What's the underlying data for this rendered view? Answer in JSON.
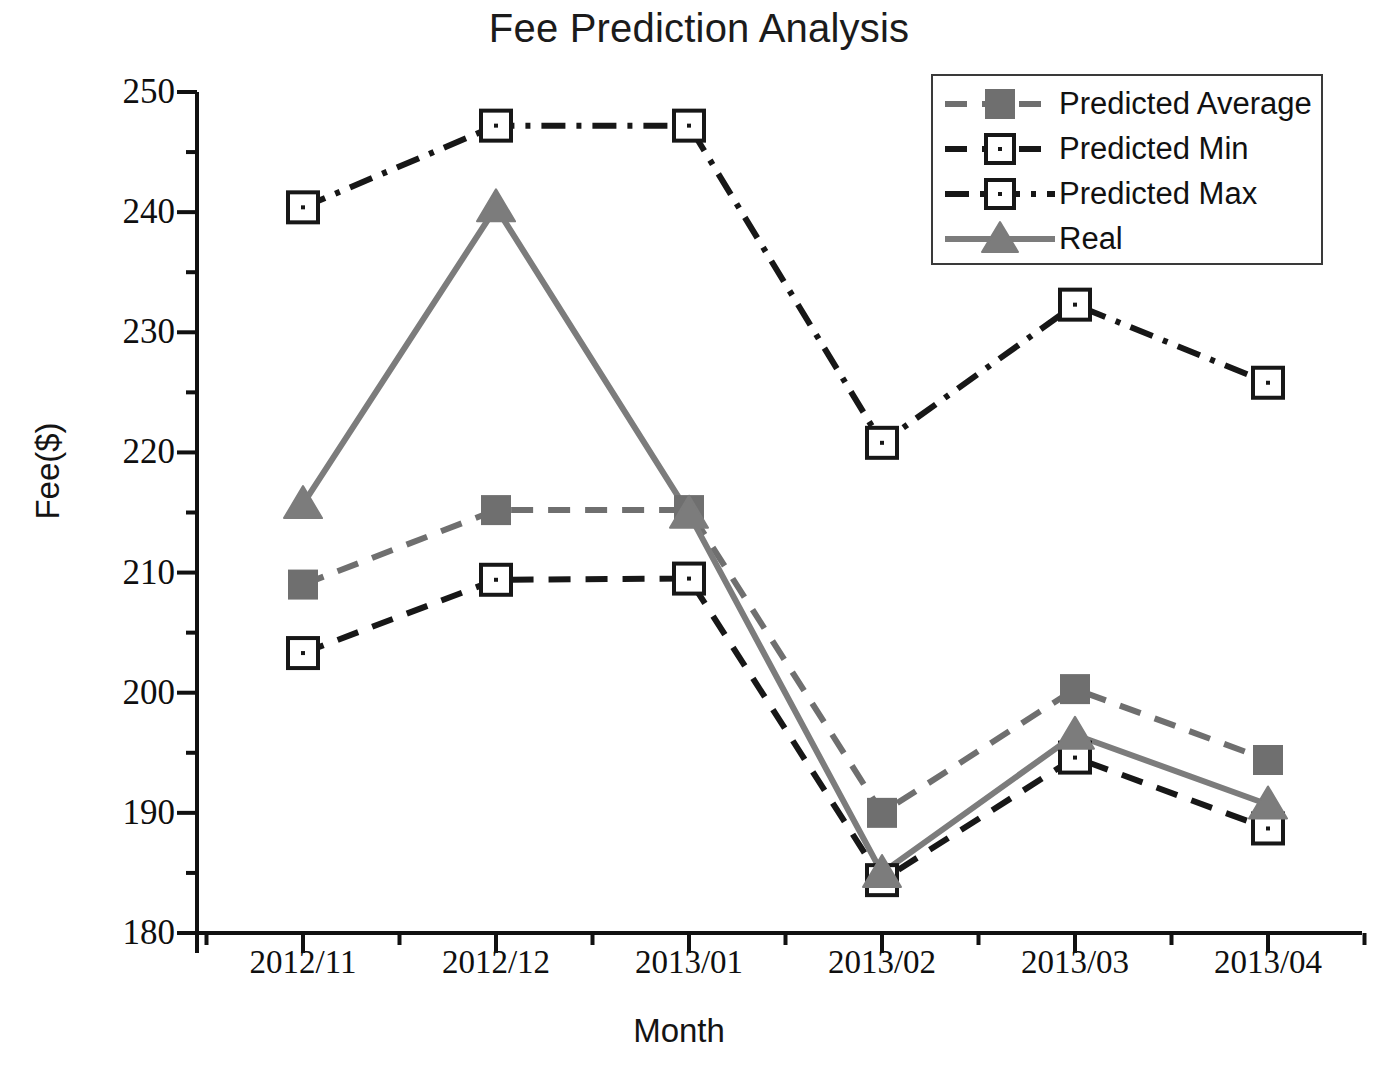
{
  "chart_data": {
    "type": "line",
    "title": "Fee Prediction Analysis",
    "xlabel": "Month",
    "ylabel": "Fee($)",
    "categories": [
      "2012/11",
      "2012/12",
      "2013/01",
      "2013/02",
      "2013/03",
      "2013/04"
    ],
    "ylim": [
      180,
      250
    ],
    "yticks": [
      180,
      190,
      200,
      210,
      220,
      230,
      240,
      250
    ],
    "ytick_labels": [
      "180",
      "190",
      "200",
      "210",
      "220",
      "230",
      "240",
      "250"
    ],
    "minor_ticks": true,
    "grid": false,
    "legend_position": "top-right",
    "series": [
      {
        "name": "Predicted Average",
        "values": [
          209.0,
          215.2,
          215.2,
          190.0,
          200.3,
          194.4
        ],
        "color": "#6f6f6f",
        "line_style": "dashed",
        "marker": "filled-square"
      },
      {
        "name": "Predicted Min",
        "values": [
          203.3,
          209.4,
          209.5,
          184.4,
          194.6,
          188.7
        ],
        "color": "#171717",
        "line_style": "dashed",
        "marker": "open-square"
      },
      {
        "name": "Predicted Max",
        "values": [
          240.4,
          247.2,
          247.2,
          220.8,
          232.3,
          225.8
        ],
        "color": "#171717",
        "line_style": "dash-dot",
        "marker": "open-square"
      },
      {
        "name": "Real",
        "values": [
          215.7,
          240.4,
          214.9,
          185.0,
          196.5,
          190.7
        ],
        "color": "#7c7c7c",
        "line_style": "solid",
        "marker": "filled-triangle"
      }
    ]
  },
  "legend": {
    "items": [
      {
        "label": "Predicted Average"
      },
      {
        "label": "Predicted Min"
      },
      {
        "label": "Predicted Max"
      },
      {
        "label": "Real"
      }
    ]
  },
  "colors": {
    "axis": "#111111",
    "predicted_average": "#6f6f6f",
    "predicted_min": "#171717",
    "predicted_max": "#171717",
    "real": "#7c7c7c",
    "background": "#ffffff"
  }
}
